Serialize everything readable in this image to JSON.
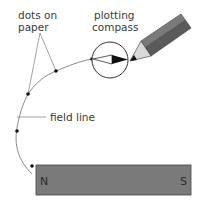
{
  "diagram": {
    "labels": {
      "dots_line1": "dots on",
      "dots_line2": "paper",
      "compass_line1": "plotting",
      "compass_line2": "compass",
      "field_line": "field line"
    },
    "magnet": {
      "north": "N",
      "south": "S",
      "color": "#7a7a7a"
    },
    "colors": {
      "line": "#8a8a8a",
      "dot": "#111111",
      "pencil_body": "#5a5a5a",
      "pencil_tip": "#d8d8d8"
    }
  }
}
